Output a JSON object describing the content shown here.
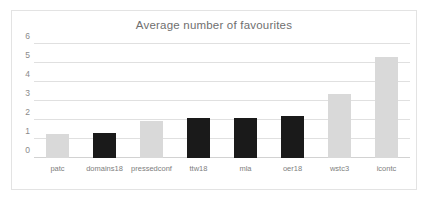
{
  "chart_data": {
    "type": "bar",
    "title": "Average number of favourites",
    "xlabel": "",
    "ylabel": "",
    "ylim": [
      0,
      6
    ],
    "yticks": [
      0,
      1,
      2,
      3,
      4,
      5,
      6
    ],
    "grid": true,
    "legend": "none",
    "categories": [
      "patc",
      "domains18",
      "pressedconf",
      "ttw18",
      "mla",
      "oer18",
      "wstc3",
      "icontc"
    ],
    "values": [
      1.25,
      1.33,
      1.95,
      2.1,
      2.1,
      2.2,
      3.35,
      5.3
    ],
    "bar_colors": [
      "#d9d9d9",
      "#1a1a1a",
      "#d9d9d9",
      "#1a1a1a",
      "#1a1a1a",
      "#1a1a1a",
      "#d9d9d9",
      "#d9d9d9"
    ]
  },
  "style": {
    "title_color": "#6f6f6f",
    "tick_color": "#8a8a8a",
    "grid_color": "#e0e0e0",
    "border_color": "#e3e3e3",
    "background": "#ffffff"
  }
}
